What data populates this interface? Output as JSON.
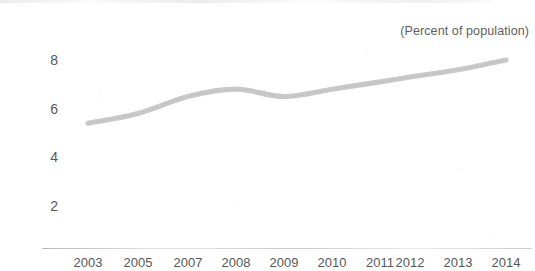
{
  "chart_data": {
    "type": "line",
    "title": "(Percent of population)",
    "xlabel": "",
    "ylabel": "",
    "grid": false,
    "legend": "none",
    "categories": [
      "2003",
      "2005",
      "2007",
      "2008",
      "2009",
      "2010",
      "2011",
      "2012",
      "2013",
      "2014"
    ],
    "values": [
      5.4,
      5.8,
      6.5,
      6.8,
      6.5,
      6.8,
      7.1,
      7.3,
      7.6,
      8.0
    ],
    "x_tick_labels": [
      "2003",
      "2005",
      "2007",
      "2008",
      "2009",
      "2010",
      "2011",
      "2012",
      "2013",
      "2014"
    ],
    "y_tick_labels": [
      "8",
      "6",
      "4",
      "2"
    ],
    "y_tick_values": [
      8,
      6,
      4,
      2
    ],
    "ylim": [
      0,
      8.8
    ],
    "series": [
      {
        "name": "percent of population",
        "values": [
          5.4,
          5.8,
          6.5,
          6.8,
          6.5,
          6.8,
          7.1,
          7.3,
          7.6,
          8.0
        ]
      }
    ],
    "line_color": "#c9c9c9",
    "text_color": "#585858"
  }
}
